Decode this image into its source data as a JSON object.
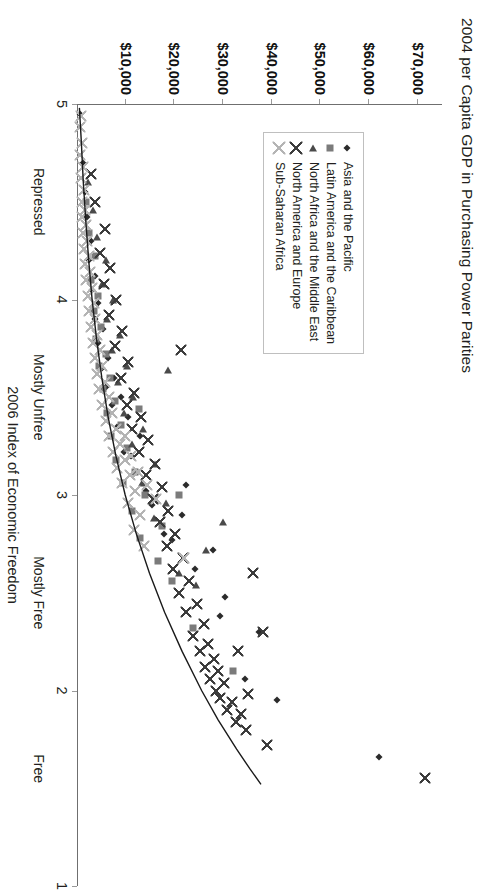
{
  "chart_data": {
    "type": "scatter",
    "title": "2004 per Capita GDP in Purchasing Power Parities",
    "xlabel": "2006 Index of Economic Freedom",
    "ylabel": "",
    "orientation": "rotated-90",
    "grid": false,
    "legend_position": "inside-left",
    "xlim": [
      5,
      1
    ],
    "x_inverted": true,
    "xticks": [
      5,
      4,
      3,
      2,
      1
    ],
    "xticklabels": [
      "5",
      "4",
      "3",
      "2",
      "1"
    ],
    "x_category_bands": [
      {
        "label": "Repressed",
        "value": 4.5
      },
      {
        "label": "Mostly Unfree",
        "value": 3.5
      },
      {
        "label": "Mostly Free",
        "value": 2.5
      },
      {
        "label": "Free",
        "value": 1.6
      }
    ],
    "ylim": [
      0,
      75000
    ],
    "yticks": [
      10000,
      20000,
      30000,
      40000,
      50000,
      60000,
      70000
    ],
    "yticklabels": [
      "$10,000",
      "$20,000",
      "$30,000",
      "$40,000",
      "$50,000",
      "$60,000",
      "$70,000"
    ],
    "trendline": {
      "label": "fitted curve",
      "color": "#1a1a1a",
      "points": [
        [
          4.98,
          500
        ],
        [
          4.8,
          900
        ],
        [
          4.6,
          1300
        ],
        [
          4.4,
          1800
        ],
        [
          4.2,
          2400
        ],
        [
          4.0,
          3100
        ],
        [
          3.8,
          4000
        ],
        [
          3.6,
          5100
        ],
        [
          3.4,
          6400
        ],
        [
          3.2,
          8000
        ],
        [
          3.0,
          9900
        ],
        [
          2.8,
          12200
        ],
        [
          2.6,
          14900
        ],
        [
          2.4,
          18000
        ],
        [
          2.2,
          21600
        ],
        [
          2.0,
          25600
        ],
        [
          1.85,
          29000
        ],
        [
          1.7,
          32800
        ],
        [
          1.6,
          35500
        ],
        [
          1.52,
          37800
        ]
      ]
    },
    "series": [
      {
        "name": "Asia and the Pacific",
        "marker": "diamond",
        "color": "#2b2b2b",
        "points": [
          [
            1.66,
            62000
          ],
          [
            1.95,
            41000
          ],
          [
            2.06,
            34500
          ],
          [
            2.3,
            37500
          ],
          [
            2.38,
            29300
          ],
          [
            2.48,
            30500
          ],
          [
            2.62,
            24300
          ],
          [
            2.72,
            28000
          ],
          [
            2.77,
            19500
          ],
          [
            2.8,
            17900
          ],
          [
            2.9,
            21500
          ],
          [
            2.95,
            15500
          ],
          [
            3.02,
            14200
          ],
          [
            3.05,
            22500
          ],
          [
            3.12,
            12400
          ],
          [
            3.2,
            11000
          ],
          [
            3.22,
            9600
          ],
          [
            3.3,
            13000
          ],
          [
            3.35,
            8200
          ],
          [
            3.4,
            10400
          ],
          [
            3.46,
            7100
          ],
          [
            3.5,
            9100
          ],
          [
            3.55,
            6000
          ],
          [
            3.6,
            7600
          ],
          [
            3.65,
            5200
          ],
          [
            3.7,
            6400
          ],
          [
            3.78,
            4300
          ],
          [
            3.85,
            5400
          ],
          [
            3.9,
            3600
          ],
          [
            3.98,
            4400
          ],
          [
            4.05,
            3000
          ],
          [
            4.12,
            3700
          ],
          [
            4.2,
            2500
          ],
          [
            4.3,
            2900
          ],
          [
            4.42,
            2000
          ],
          [
            4.55,
            1600
          ],
          [
            4.7,
            1200
          ],
          [
            4.95,
            600
          ]
        ]
      },
      {
        "name": "Latin America and the Caribbean",
        "marker": "square",
        "color": "#7b7b7b",
        "points": [
          [
            2.1,
            32000
          ],
          [
            2.32,
            23800
          ],
          [
            2.56,
            19600
          ],
          [
            2.66,
            16600
          ],
          [
            2.78,
            13000
          ],
          [
            2.84,
            17400
          ],
          [
            2.92,
            11200
          ],
          [
            3.0,
            14000
          ],
          [
            3.06,
            9400
          ],
          [
            3.12,
            12000
          ],
          [
            3.18,
            8000
          ],
          [
            3.24,
            10200
          ],
          [
            3.3,
            7000
          ],
          [
            3.36,
            9000
          ],
          [
            3.42,
            6100
          ],
          [
            3.48,
            7800
          ],
          [
            3.54,
            5400
          ],
          [
            3.6,
            6800
          ],
          [
            3.66,
            4600
          ],
          [
            3.72,
            5900
          ],
          [
            3.8,
            4000
          ],
          [
            3.86,
            5000
          ],
          [
            3.94,
            3400
          ],
          [
            4.02,
            4300
          ],
          [
            4.1,
            2900
          ],
          [
            4.22,
            3600
          ],
          [
            4.34,
            2400
          ],
          [
            4.5,
            1900
          ],
          [
            3.44,
            12800
          ],
          [
            3.0,
            21000
          ]
        ]
      },
      {
        "name": "North Africa and the Middle East",
        "marker": "triangle",
        "color": "#4a4a4a",
        "points": [
          [
            2.54,
            24500
          ],
          [
            2.6,
            21000
          ],
          [
            2.72,
            26600
          ],
          [
            2.88,
            15800
          ],
          [
            2.96,
            18200
          ],
          [
            3.06,
            13400
          ],
          [
            3.16,
            16000
          ],
          [
            3.26,
            11400
          ],
          [
            3.34,
            13600
          ],
          [
            3.42,
            9600
          ],
          [
            3.5,
            11600
          ],
          [
            3.58,
            8400
          ],
          [
            3.66,
            10200
          ],
          [
            3.74,
            7200
          ],
          [
            3.82,
            8800
          ],
          [
            3.9,
            6200
          ],
          [
            4.0,
            7400
          ],
          [
            4.08,
            5200
          ],
          [
            4.2,
            6000
          ],
          [
            4.32,
            4200
          ],
          [
            4.46,
            3200
          ],
          [
            4.6,
            2300
          ],
          [
            2.86,
            30000
          ],
          [
            3.64,
            18800
          ]
        ]
      },
      {
        "name": "North America and Europe",
        "marker": "cross",
        "color": "#3c3c3c",
        "points": [
          [
            1.55,
            71500
          ],
          [
            1.72,
            39000
          ],
          [
            1.8,
            34800
          ],
          [
            1.84,
            32600
          ],
          [
            1.88,
            33600
          ],
          [
            1.9,
            30800
          ],
          [
            1.94,
            31800
          ],
          [
            1.96,
            29400
          ],
          [
            1.98,
            35200
          ],
          [
            2.0,
            28600
          ],
          [
            2.04,
            30200
          ],
          [
            2.06,
            27400
          ],
          [
            2.1,
            29000
          ],
          [
            2.12,
            26200
          ],
          [
            2.16,
            28200
          ],
          [
            2.2,
            25200
          ],
          [
            2.24,
            27000
          ],
          [
            2.28,
            23800
          ],
          [
            2.3,
            38200
          ],
          [
            2.34,
            26000
          ],
          [
            2.4,
            22400
          ],
          [
            2.44,
            24600
          ],
          [
            2.5,
            21000
          ],
          [
            2.56,
            23000
          ],
          [
            2.6,
            36200
          ],
          [
            2.62,
            19800
          ],
          [
            2.68,
            21800
          ],
          [
            2.74,
            18400
          ],
          [
            2.8,
            20200
          ],
          [
            2.86,
            17000
          ],
          [
            2.92,
            18800
          ],
          [
            2.98,
            15600
          ],
          [
            3.04,
            17400
          ],
          [
            3.1,
            14200
          ],
          [
            3.16,
            16000
          ],
          [
            3.22,
            12800
          ],
          [
            3.28,
            14600
          ],
          [
            3.34,
            11400
          ],
          [
            3.4,
            13200
          ],
          [
            3.46,
            10200
          ],
          [
            3.52,
            11800
          ],
          [
            3.6,
            9000
          ],
          [
            3.68,
            10400
          ],
          [
            3.76,
            7800
          ],
          [
            3.84,
            9200
          ],
          [
            3.92,
            6600
          ],
          [
            4.0,
            8000
          ],
          [
            4.08,
            5600
          ],
          [
            4.16,
            6800
          ],
          [
            4.24,
            4800
          ],
          [
            4.36,
            5800
          ],
          [
            4.5,
            3800
          ],
          [
            4.64,
            2800
          ],
          [
            3.74,
            21400
          ],
          [
            2.2,
            33000
          ]
        ]
      },
      {
        "name": "Sub-Saharan Africa",
        "marker": "cross-light",
        "color": "#b4b4b4",
        "points": [
          [
            2.68,
            22000
          ],
          [
            2.74,
            13800
          ],
          [
            2.82,
            11800
          ],
          [
            2.9,
            13000
          ],
          [
            2.96,
            10400
          ],
          [
            3.02,
            12000
          ],
          [
            3.06,
            9200
          ],
          [
            3.1,
            10800
          ],
          [
            3.14,
            8200
          ],
          [
            3.18,
            9800
          ],
          [
            3.22,
            7400
          ],
          [
            3.26,
            8800
          ],
          [
            3.3,
            6600
          ],
          [
            3.34,
            8000
          ],
          [
            3.38,
            5900
          ],
          [
            3.42,
            7200
          ],
          [
            3.46,
            5200
          ],
          [
            3.5,
            6500
          ],
          [
            3.54,
            4600
          ],
          [
            3.58,
            5800
          ],
          [
            3.62,
            4100
          ],
          [
            3.66,
            5200
          ],
          [
            3.7,
            3600
          ],
          [
            3.74,
            4700
          ],
          [
            3.78,
            3200
          ],
          [
            3.82,
            4200
          ],
          [
            3.86,
            2800
          ],
          [
            3.9,
            3800
          ],
          [
            3.94,
            2500
          ],
          [
            3.98,
            3400
          ],
          [
            4.02,
            2200
          ],
          [
            4.06,
            3000
          ],
          [
            4.1,
            1900
          ],
          [
            4.14,
            2700
          ],
          [
            4.18,
            1700
          ],
          [
            4.22,
            2400
          ],
          [
            4.26,
            1500
          ],
          [
            4.3,
            2100
          ],
          [
            4.34,
            1300
          ],
          [
            4.38,
            1900
          ],
          [
            4.42,
            1100
          ],
          [
            4.46,
            1700
          ],
          [
            4.5,
            950
          ],
          [
            4.56,
            1500
          ],
          [
            4.62,
            820
          ],
          [
            4.68,
            1300
          ],
          [
            4.74,
            700
          ],
          [
            4.8,
            1100
          ],
          [
            4.88,
            600
          ],
          [
            4.94,
            900
          ],
          [
            3.3,
            9900
          ],
          [
            3.2,
            11000
          ],
          [
            3.12,
            12600
          ],
          [
            3.05,
            14400
          ],
          [
            2.98,
            16200
          ]
        ]
      }
    ]
  },
  "legend": {
    "items": [
      {
        "label": "Asia and the Pacific",
        "marker": "diamond"
      },
      {
        "label": "Latin America and the Caribbean",
        "marker": "square"
      },
      {
        "label": "North Africa and the Middle East",
        "marker": "triangle"
      },
      {
        "label": "North America and Europe",
        "marker": "cross"
      },
      {
        "label": "Sub-Saharan Africa",
        "marker": "cross-light"
      }
    ]
  }
}
